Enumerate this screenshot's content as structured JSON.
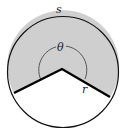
{
  "diagram": {
    "labels": {
      "arc": "s",
      "angle": "θ",
      "radius": "r"
    },
    "colors": {
      "sector_fill": "#cfcfcf",
      "outline": "#111111",
      "background": "#ffffff",
      "angle_arc": "#555555"
    },
    "geometry": {
      "center": [
        62,
        70
      ],
      "radius": 56,
      "left_radius_end": [
        14,
        93
      ],
      "right_radius_end": [
        110,
        97
      ],
      "angle_marker_radius": 24
    }
  }
}
